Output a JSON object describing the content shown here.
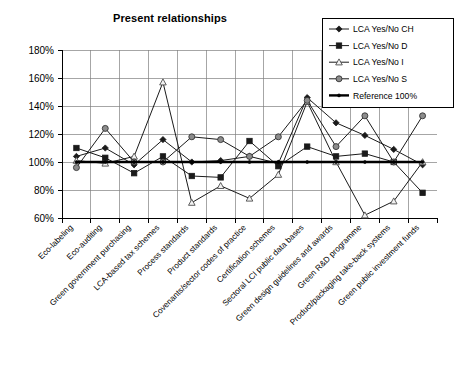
{
  "chart_data": {
    "type": "line",
    "title": "Present relationships",
    "xlabel": "",
    "ylabel": "",
    "ylim": [
      60,
      180
    ],
    "ytick_labels": [
      "180%",
      "160%",
      "140%",
      "120%",
      "100%",
      "80%",
      "60%"
    ],
    "ytick_values": [
      180,
      160,
      140,
      120,
      100,
      80,
      60
    ],
    "grid": true,
    "legend_position": "top-right",
    "categories": [
      "Eco-labeling",
      "Eco-auditing",
      "Green government purchasing",
      "LCA-based tax schemes",
      "Process standards",
      "Product standards",
      "Covenants/sector codes of practice",
      "Certification schemes",
      "Sectoral LCI public data bases",
      "Green design guidelines and awards",
      "Green R&D programme",
      "Product/packaging take-back systems",
      "Green public investment funds"
    ],
    "series": [
      {
        "name": "LCA Yes/No CH",
        "marker": "diamond",
        "values": [
          104,
          110,
          98,
          116,
          100,
          101,
          104,
          99,
          146,
          128,
          119,
          109,
          98
        ]
      },
      {
        "name": "LCA Yes/No D",
        "marker": "square",
        "values": [
          110,
          103,
          92,
          104,
          90,
          89,
          115,
          97,
          111,
          104,
          106,
          100,
          78
        ]
      },
      {
        "name": "LCA Yes/No I",
        "marker": "triangle",
        "values": [
          101,
          99,
          104,
          157,
          71,
          83,
          74,
          91,
          143,
          100,
          62,
          72,
          100
        ]
      },
      {
        "name": "LCA Yes/No S",
        "marker": "circle",
        "values": [
          96,
          124,
          100,
          100,
          118,
          116,
          104,
          118,
          144,
          111,
          133,
          100,
          133
        ]
      },
      {
        "name": "Reference 100%",
        "marker": "reference",
        "values": [
          100,
          100,
          100,
          100,
          100,
          100,
          100,
          100,
          100,
          100,
          100,
          100,
          100
        ]
      }
    ]
  },
  "legend": {
    "entries": [
      {
        "label": "LCA Yes/No CH"
      },
      {
        "label": "LCA Yes/No D"
      },
      {
        "label": "LCA Yes/No I"
      },
      {
        "label": "LCA Yes/No S"
      },
      {
        "label": "Reference 100%"
      }
    ]
  },
  "colors": {
    "series_stroke": "#1a1a1a",
    "reference_stroke": "#000000",
    "grid": "#808080",
    "axis": "#000000",
    "background": "#ffffff"
  }
}
